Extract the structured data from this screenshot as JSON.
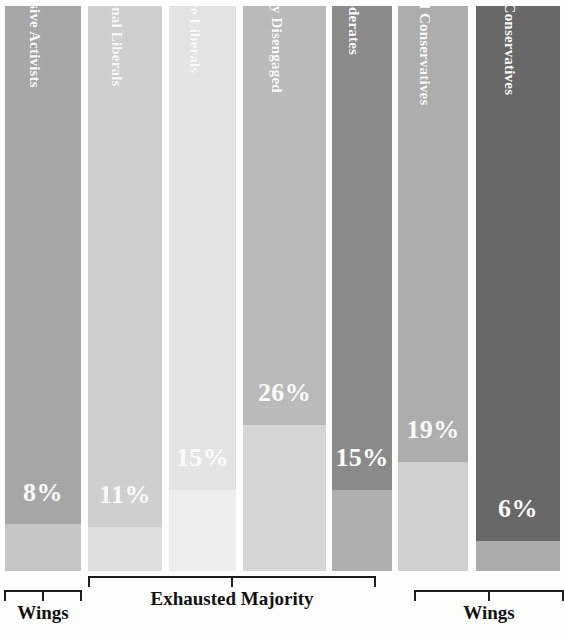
{
  "chart_data": {
    "type": "bar",
    "title": "",
    "subtitle": "",
    "xlabel": "",
    "ylabel": "",
    "orientation": "vertical",
    "stacked_fill": true,
    "grid": false,
    "legend": "none",
    "ylim": [
      0,
      100
    ],
    "categories": [
      "Progressive Activists",
      "Traditional Liberals",
      "Passive Liberals",
      "Politically Disengaged",
      "Moderates",
      "Traditional Conservatives",
      "Devoted Conservatives"
    ],
    "values": [
      8,
      11,
      15,
      26,
      15,
      19,
      6
    ],
    "value_labels": [
      "8%",
      "11%",
      "15%",
      "26%",
      "15%",
      "19%",
      "6%"
    ],
    "colors": [
      "#a9a9a9",
      "#d2d2d2",
      "#e7e7e7",
      "#bdbdbd",
      "#8d8d8d",
      "#b0b0b0",
      "#6a6a6a"
    ],
    "remainder_color": "#cfcfcf",
    "label_color": "#ffffff",
    "annotations": [
      {
        "label": "Wings",
        "segments": [
          "Progressive Activists"
        ]
      },
      {
        "label": "Exhausted Majority",
        "segments": [
          "Traditional Liberals",
          "Passive Liberals",
          "Politically Disengaged",
          "Moderates"
        ]
      },
      {
        "label": "Wings",
        "segments": [
          "Traditional Conservatives",
          "Devoted Conservatives"
        ]
      }
    ]
  },
  "bars": [
    {
      "name": "Progressive Activists",
      "value": "8%",
      "x": 5,
      "width": 76,
      "fill_color": "#a9a9a9",
      "rest_color": "#c9c9c9",
      "fill_top": 0,
      "fill_bottom": 524,
      "value_y": 478
    },
    {
      "name": "Traditional Liberals",
      "value": "11%",
      "x": 88,
      "width": 74,
      "fill_color": "#d2d2d2",
      "rest_color": "#e2e2e2",
      "fill_top": 0,
      "fill_bottom": 527,
      "value_y": 480
    },
    {
      "name": "Passive Liberals",
      "value": "15%",
      "x": 169,
      "width": 67,
      "fill_color": "#e7e7e7",
      "rest_color": "#f1f1f1",
      "fill_top": 0,
      "fill_bottom": 490,
      "value_y": 443
    },
    {
      "name": "Politically Disengaged",
      "value": "26%",
      "x": 243,
      "width": 83,
      "fill_color": "#bdbdbd",
      "rest_color": "#dadada",
      "fill_top": 0,
      "fill_bottom": 425,
      "value_y": 378
    },
    {
      "name": "Moderates",
      "value": "15%",
      "x": 332,
      "width": 60,
      "fill_color": "#8d8d8d",
      "rest_color": "#b2b2b2",
      "fill_top": 0,
      "fill_bottom": 490,
      "value_y": 443
    },
    {
      "name": "Traditional Conservatives",
      "value": "19%",
      "x": 398,
      "width": 70,
      "fill_color": "#b0b0b0",
      "rest_color": "#d3d3d3",
      "fill_top": 0,
      "fill_bottom": 462,
      "value_y": 415
    },
    {
      "name": "Devoted Conservatives",
      "value": "6%",
      "x": 476,
      "width": 84,
      "fill_color": "#6a6a6a",
      "rest_color": "#aeaeae",
      "fill_top": 0,
      "fill_bottom": 541,
      "value_y": 494
    }
  ],
  "brackets": [
    {
      "label": "Wings",
      "left": 4,
      "width": 78,
      "top": 14
    },
    {
      "label": "Exhausted Majority",
      "left": 88,
      "width": 288,
      "top": 0
    },
    {
      "label": "Wings",
      "left": 414,
      "width": 150,
      "top": 14
    }
  ]
}
